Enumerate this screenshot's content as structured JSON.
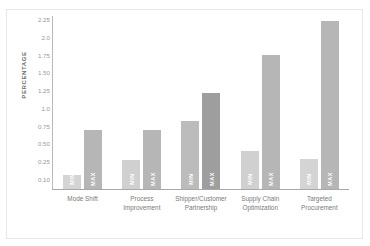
{
  "title_strip": "",
  "chart_data": {
    "type": "bar",
    "title": "",
    "subtitle": "",
    "xlabel": "",
    "ylabel": "PERCENTAGE",
    "grid": false,
    "legend_position": "in-bar",
    "axis": {
      "y_tick_labels": [
        "2.25",
        "2.0",
        "1.75",
        "1.50",
        "1.25",
        "1.0",
        "0.75",
        "0.50",
        "0.25",
        "0.10"
      ],
      "y_tick_values": [
        2.25,
        2.0,
        1.75,
        1.5,
        1.25,
        1.0,
        0.75,
        0.5,
        0.25,
        0.1
      ],
      "ylim": [
        0,
        2.4
      ]
    },
    "categories": [
      "Mode Shift",
      "Process Improvement",
      "Shipper/Customer Partnership",
      "Supply Chain Optimization",
      "Targeted Procurement"
    ],
    "series": [
      {
        "name": "MIN",
        "color": "#d2d2d2",
        "values": [
          0.1,
          0.24,
          0.87,
          0.35,
          0.25
        ]
      },
      {
        "name": "MAX",
        "color": "#b4b4b4",
        "values": [
          0.73,
          0.73,
          1.23,
          1.73,
          2.2
        ]
      }
    ],
    "bar_colors": {
      "min_default": "#d2d2d2",
      "max_default": "#b4b4b4",
      "max_highlight": "#9e9e9e"
    },
    "highlight_category": "Shipper/Customer Partnership"
  },
  "groups": [
    {
      "category_line1": "Mode Shift",
      "category_line2": "",
      "min": {
        "label": "MIN",
        "value": 0.1,
        "height_px": 14,
        "color": "#d4d4d4"
      },
      "max": {
        "label": "MAX",
        "value": 0.73,
        "height_px": 59,
        "color": "#b6b6b6"
      }
    },
    {
      "category_line1": "Process",
      "category_line2": "Improvement",
      "min": {
        "label": "MIN",
        "value": 0.24,
        "height_px": 29,
        "color": "#d0d0d0"
      },
      "max": {
        "label": "MAX",
        "value": 0.73,
        "height_px": 59,
        "color": "#b6b6b6"
      }
    },
    {
      "category_line1": "Shipper/Customer",
      "category_line2": "Partnership",
      "min": {
        "label": "MIN",
        "value": 0.87,
        "height_px": 68,
        "color": "#bcbcbc"
      },
      "max": {
        "label": "MAX",
        "value": 1.23,
        "height_px": 96,
        "color": "#9e9e9e"
      }
    },
    {
      "category_line1": "Supply Chain",
      "category_line2": "Optimization",
      "min": {
        "label": "MIN",
        "value": 0.35,
        "height_px": 38,
        "color": "#d0d0d0"
      },
      "max": {
        "label": "MAX",
        "value": 1.73,
        "height_px": 134,
        "color": "#b6b6b6"
      }
    },
    {
      "category_line1": "Targeted",
      "category_line2": "Procurement",
      "min": {
        "label": "MIN",
        "value": 0.25,
        "height_px": 30,
        "color": "#d4d4d4"
      },
      "max": {
        "label": "MAX",
        "value": 2.2,
        "height_px": 168,
        "color": "#b6b6b6"
      }
    }
  ]
}
